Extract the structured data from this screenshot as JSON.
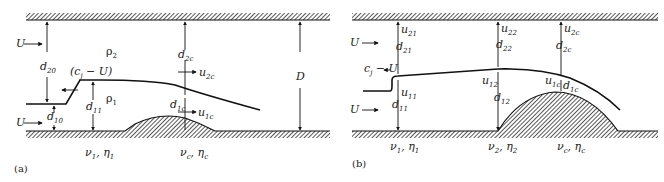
{
  "panel_a": {
    "caption": "(a)",
    "labels": {
      "U_top": "U",
      "U_bottom": "U",
      "rho2": "ρ",
      "rho2_sub": "2",
      "rho1": "ρ",
      "rho1_sub": "1",
      "d20": "d",
      "d20_sub": "20",
      "d10": "d",
      "d10_sub": "10",
      "d11": "d",
      "d11_sub": "11",
      "d2c": "d",
      "d2c_sub": "2c",
      "d1c": "d",
      "d1c_sub": "1c",
      "u2c": "u",
      "u2c_sub": "2c",
      "u1c": "u",
      "u1c_sub": "1c",
      "front_speed": "(c",
      "front_speed_sub": "j",
      "front_speed_tail": " − U)",
      "D": "D",
      "visc1": "ν",
      "visc1_sub": "1",
      "visc1_sep": ", η",
      "visc1_sub2": "1",
      "viscc": "ν",
      "viscc_sub": "c",
      "viscc_sep": ", η",
      "viscc_sub2": "c"
    }
  },
  "panel_b": {
    "caption": "(b)",
    "labels": {
      "U_top": "U",
      "U_bottom": "U",
      "front_speed": "c",
      "front_speed_sub": "j",
      "front_speed_tail": " − U",
      "u21": "u",
      "u21_sub": "21",
      "d21": "d",
      "d21_sub": "21",
      "u11": "u",
      "u11_sub": "11",
      "d11": "d",
      "d11_sub": "11",
      "u22": "u",
      "u22_sub": "22",
      "d22": "d",
      "d22_sub": "22",
      "u12": "u",
      "u12_sub": "12",
      "d12": "d",
      "d12_sub": "12",
      "u2c": "u",
      "u2c_sub": "2c",
      "d2c": "d",
      "d2c_sub": "2c",
      "u1c": "u",
      "u1c_sub": "1c",
      "d1c": "d",
      "d1c_sub": "1c",
      "visc1": "ν",
      "visc1_sub": "1",
      "visc1_sep": ", η",
      "visc1_sub2": "1",
      "visc2": "ν",
      "visc2_sub": "2",
      "visc2_sep": ", η",
      "visc2_sub2": "2",
      "viscc": "ν",
      "viscc_sub": "c",
      "viscc_sep": ", η",
      "viscc_sub2": "c"
    }
  }
}
